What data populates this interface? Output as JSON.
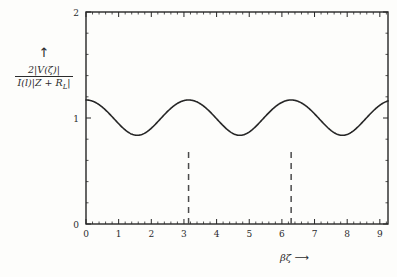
{
  "chart_data": {
    "type": "line",
    "title": "",
    "subtitle": "",
    "xlabel": "βζ",
    "xlabel_arrow": "⟶",
    "ylabel_numerator": "2|V(ζ)|",
    "ylabel_denominator": "I(l)|Z + R_L|",
    "ylabel_arrow": "↑",
    "xlim": [
      0,
      9.25
    ],
    "ylim": [
      0,
      2
    ],
    "xticks": [
      0,
      1,
      2,
      3,
      4,
      5,
      6,
      7,
      8,
      9
    ],
    "xtick_labels": [
      "0",
      "1",
      "2",
      "3",
      "4",
      "5",
      "6",
      "7",
      "8",
      "9"
    ],
    "yticks": [
      0,
      1,
      2
    ],
    "ytick_labels": [
      "0",
      "1",
      "2"
    ],
    "minor_xticks_per_interval": 5,
    "minor_yticks_per_interval": 5,
    "grid": false,
    "legend": null,
    "line_color": "#262626",
    "line_width": 1.6,
    "series": [
      {
        "name": "normalized standing wave magnitude",
        "formula": "sqrt(1.0345 + 0.3345*cos(2*x))",
        "x": [
          0.0,
          0.1,
          0.2,
          0.3,
          0.4,
          0.5,
          0.6,
          0.7,
          0.8,
          0.9,
          1.0,
          1.1,
          1.2,
          1.3,
          1.4,
          1.5,
          1.5708,
          1.6,
          1.7,
          1.8,
          1.9,
          2.0,
          2.1,
          2.2,
          2.3,
          2.4,
          2.5,
          2.6,
          2.7,
          2.8,
          2.9,
          3.0,
          3.1416,
          3.2,
          3.3,
          3.4,
          3.5,
          3.6,
          3.7,
          3.8,
          3.9,
          4.0,
          4.1,
          4.2,
          4.3,
          4.4,
          4.5,
          4.6,
          4.7124,
          4.8,
          4.9,
          5.0,
          5.1,
          5.2,
          5.3,
          5.4,
          5.5,
          5.6,
          5.7,
          5.8,
          5.9,
          6.0,
          6.1,
          6.2832,
          6.4,
          6.5,
          6.6,
          6.7,
          6.8,
          6.9,
          7.0,
          7.1,
          7.2,
          7.3,
          7.4,
          7.5,
          7.6,
          7.7,
          7.8539,
          8.0,
          8.1,
          8.2,
          8.3,
          8.4,
          8.5,
          8.6,
          8.7,
          8.8,
          8.9,
          9.0,
          9.1,
          9.25
        ],
        "y": [
          0.7,
          0.704,
          0.718,
          0.741,
          0.772,
          0.81,
          0.854,
          0.901,
          0.95,
          0.999,
          1.048,
          1.095,
          1.139,
          1.178,
          1.212,
          1.24,
          1.25,
          1.256,
          1.266,
          1.268,
          1.263,
          1.251,
          1.232,
          1.207,
          1.176,
          1.141,
          1.102,
          1.061,
          1.018,
          0.975,
          0.933,
          0.893,
          0.7,
          0.862,
          0.835,
          0.813,
          0.796,
          0.785,
          0.78,
          0.782,
          0.79,
          0.804,
          0.824,
          0.85,
          0.88,
          0.914,
          0.951,
          0.99,
          1.25,
          1.07,
          1.11,
          1.149,
          1.185,
          1.216,
          1.241,
          1.259,
          1.269,
          1.271,
          1.265,
          1.251,
          1.229,
          1.201,
          1.167,
          0.7,
          1.055,
          1.013,
          0.971,
          0.93,
          0.891,
          0.857,
          0.828,
          0.806,
          0.791,
          0.783,
          0.783,
          0.791,
          0.806,
          0.829,
          1.25,
          0.914,
          0.951,
          0.991,
          1.032,
          1.073,
          1.113,
          1.151,
          1.186,
          1.216,
          1.241,
          1.259,
          1.269,
          1.25
        ]
      }
    ],
    "annotations": [
      {
        "name": "dashed-line-pi",
        "type": "vline",
        "x": 3.1416,
        "y_from": 0,
        "y_to": 0.7,
        "style": "dashed",
        "color": "#4b4b4b"
      },
      {
        "name": "dashed-line-two-pi",
        "type": "vline",
        "x": 6.2832,
        "y_from": 0,
        "y_to": 0.7,
        "style": "dashed",
        "color": "#4b4b4b"
      }
    ],
    "extrema": {
      "maxima_x": [
        1.5708,
        4.7124,
        7.8539
      ],
      "maxima_y": 1.37,
      "minima_x": [
        0.0,
        3.1416,
        6.2832
      ],
      "minima_y": 0.7
    }
  }
}
